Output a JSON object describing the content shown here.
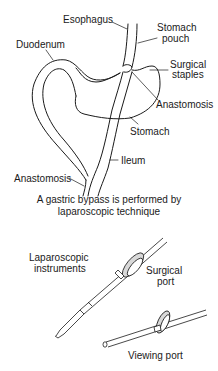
{
  "diagram": {
    "title_caption": {
      "line1": "A gastric bypass is performed by",
      "line2": "laparoscopic technique"
    },
    "anatomy_labels": {
      "esophagus": "Esophagus",
      "stomach_pouch_l1": "Stomach",
      "stomach_pouch_l2": "pouch",
      "duodenum": "Duodenum",
      "surgical_staples_l1": "Surgical",
      "surgical_staples_l2": "staples",
      "anastomosis_upper": "Anastomosis",
      "stomach": "Stomach",
      "ileum": "Ileum",
      "anastomosis_lower": "Anastomosis"
    },
    "instrument_labels": {
      "laparoscopic_l1": "Laparoscopic",
      "laparoscopic_l2": "instruments",
      "surgical_port_l1": "Surgical",
      "surgical_port_l2": "port",
      "viewing_port": "Viewing port"
    },
    "colors": {
      "line": "#1a1a1a",
      "port_shade": "#d8d8d8",
      "background": "#ffffff"
    }
  }
}
